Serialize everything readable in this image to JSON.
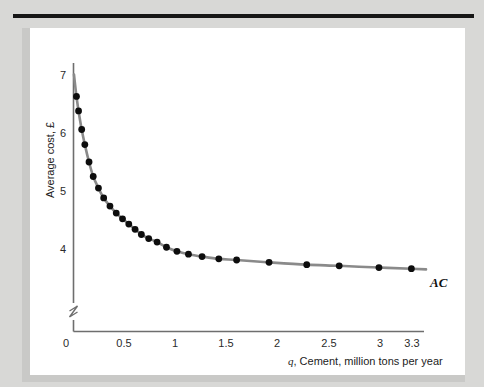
{
  "figure": {
    "background_color": "#d8d8d6",
    "panel_color": "#ffffff",
    "rule_color": "#161616"
  },
  "chart_data": {
    "type": "line",
    "title": "",
    "subtitle": "",
    "xlabel": "q, Cement, million tons per year",
    "xlabel_italic_prefix": "q",
    "xlabel_rest": ", Cement, million tons per year",
    "ylabel": "Average cost, £",
    "grid": false,
    "legend_position": "right-end-of-curve",
    "xlim": [
      0,
      3.45
    ],
    "ylim": [
      3.3,
      7.25
    ],
    "y_axis_break": true,
    "y_axis_break_note": "axis broken between 0 and ~3.4",
    "xticks": [
      0,
      0.5,
      1,
      1.5,
      2,
      2.5,
      3,
      3.3
    ],
    "xticklabels": [
      "0",
      "0.5",
      "1",
      "1.5",
      "2",
      "2.5",
      "3",
      "3.3"
    ],
    "yticks": [
      4,
      5,
      6,
      7
    ],
    "yticklabels": [
      "4",
      "5",
      "6",
      "7"
    ],
    "series": [
      {
        "name": "AC",
        "label": "AC",
        "marker": "filled-circle",
        "marker_color": "#0d0d0d",
        "line_color": "#8a8a8a",
        "x": [
          0.1,
          0.12,
          0.15,
          0.18,
          0.22,
          0.26,
          0.31,
          0.36,
          0.42,
          0.48,
          0.54,
          0.6,
          0.66,
          0.72,
          0.79,
          0.87,
          0.96,
          1.06,
          1.17,
          1.3,
          1.46,
          1.63,
          1.94,
          2.3,
          2.61,
          2.99,
          3.3
        ],
        "y": [
          6.63,
          6.38,
          6.06,
          5.8,
          5.5,
          5.25,
          5.05,
          4.88,
          4.74,
          4.62,
          4.52,
          4.43,
          4.34,
          4.25,
          4.18,
          4.12,
          4.03,
          3.96,
          3.91,
          3.87,
          3.83,
          3.81,
          3.77,
          3.73,
          3.71,
          3.68,
          3.66
        ]
      }
    ]
  }
}
